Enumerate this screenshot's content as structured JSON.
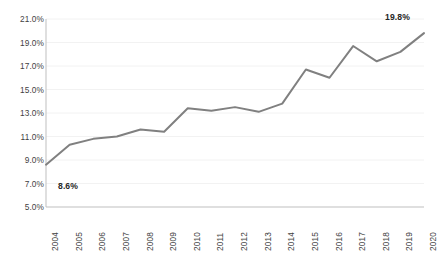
{
  "chart_data": {
    "type": "line",
    "title": "",
    "subtitle": "",
    "xlabel": "",
    "ylabel": "",
    "categories": [
      "2004",
      "2005",
      "2006",
      "2007",
      "2008",
      "2009",
      "2010",
      "2011",
      "2012",
      "2013",
      "2014",
      "2015",
      "2016",
      "2017",
      "2018",
      "2019",
      "2020"
    ],
    "series": [
      {
        "name": "",
        "color": "#808080",
        "values": [
          8.6,
          10.3,
          10.8,
          11.0,
          11.6,
          11.4,
          13.4,
          13.2,
          13.5,
          13.1,
          13.8,
          16.7,
          16.0,
          18.7,
          17.4,
          18.2,
          19.8
        ]
      }
    ],
    "ylim": [
      5.0,
      21.0
    ],
    "ytick_values": [
      21.0,
      19.0,
      17.0,
      15.0,
      13.0,
      11.0,
      9.0,
      7.0,
      5.0
    ],
    "ytick_labels": [
      "21.0%",
      "19.0%",
      "17.0%",
      "15.0%",
      "13.0%",
      "11.0%",
      "9.0%",
      "7.0%",
      "5.0%"
    ],
    "xtick_labels": [
      "2004",
      "2005",
      "2006",
      "2007",
      "2008",
      "2009",
      "2010",
      "2011",
      "2012",
      "2013",
      "2014",
      "2015",
      "2016",
      "2017",
      "2018",
      "2019",
      "2020"
    ],
    "xtick_rotation": -90,
    "grid": {
      "horizontal": true,
      "vertical": false,
      "color": "#f2f2f2"
    },
    "legend": {
      "visible": false,
      "position": "none"
    },
    "data_labels": [
      {
        "category": "2004",
        "value": 8.6,
        "text": "8.6%"
      },
      {
        "category": "2020",
        "value": 19.8,
        "text": "19.8%"
      }
    ],
    "axis_line_color": "#bfbfbf",
    "background": "#ffffff"
  }
}
